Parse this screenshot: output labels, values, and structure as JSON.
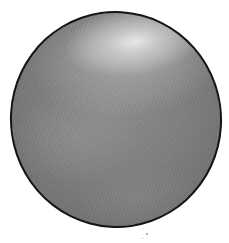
{
  "figure": {
    "colors": {
      "outline": "#141414",
      "body_mid": "#7e7e7e",
      "body_edge": "#626262",
      "highlight": "#ebebeb",
      "background": "#ffffff"
    },
    "specks": [
      {
        "x": 146,
        "y": 233
      },
      {
        "x": 142,
        "y": 238
      }
    ]
  }
}
